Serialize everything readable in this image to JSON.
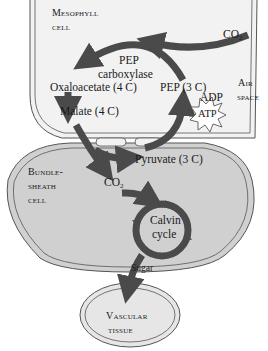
{
  "diagram": {
    "type": "C4 photosynthesis pathway",
    "compartments": {
      "mesophyll": [
        "Mesophyll",
        "cell"
      ],
      "air_space": [
        "Air",
        "space"
      ],
      "bundle_sheath": [
        "Bundle-",
        "sheath",
        "cell"
      ],
      "vascular": [
        "Vascular",
        "tissue"
      ]
    },
    "molecules": {
      "co2_in": "CO",
      "co2_in_sub": "2",
      "pep_carboxylase": [
        "PEP",
        "carboxylase"
      ],
      "oxaloacetate": "Oxaloacetate (4 C)",
      "pep": "PEP (3 C)",
      "malate": "Malate (4 C)",
      "adp": "ADP",
      "atp": "ATP",
      "pyruvate": "Pyruvate (3 C)",
      "co2_bs": "CO",
      "co2_bs_sub": "2",
      "calvin": [
        "Calvin",
        "cycle"
      ],
      "sugar": "Sugar"
    },
    "colors": {
      "mesophyll_fill": "#f2f2f2",
      "bundle_fill": "#d0d0d0",
      "vascular_fill": "#e6e6e6",
      "arrow": "#4a4a4a",
      "outline": "#555555"
    }
  }
}
